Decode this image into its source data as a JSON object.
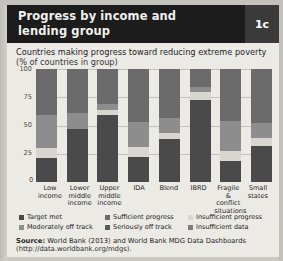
{
  "header": {
    "title_line1": "Progress by income and",
    "title_line2": "lending group",
    "badge": "1c"
  },
  "subtitle": {
    "line1": "Countries making progress toward reducing extreme poverty",
    "line2": "(% of countries in group)"
  },
  "source": {
    "label": "Source:",
    "text": " World Bank (2013) and World Bank MDG Data Dashboards",
    "url": "(http://data.worldbank.org/mdgs)."
  },
  "colors": {
    "target_met": "#4a4a4a",
    "moderately_off_track": "#8d8d8d",
    "sufficient_progress": "#6b6b6b",
    "seriously_off_track": "#5a5a5a",
    "insufficient_progress": "#d8d6d1",
    "insufficient_data": "#7d7d7d",
    "header_bg": "#1c1c1c",
    "badge_bg": "#3a3a3a",
    "card_bg": "#eceae5"
  },
  "chart_data": {
    "type": "bar",
    "subtype": "stacked-bar-100",
    "title": "Countries making progress toward reducing extreme poverty",
    "subtitle": "(% of countries in group)",
    "xlabel": "",
    "ylabel": "% of countries in group",
    "ylim": [
      0,
      100
    ],
    "yticks": [
      0,
      25,
      50,
      75,
      100
    ],
    "ytick_labels": [
      "0",
      "25",
      "50",
      "75",
      "100"
    ],
    "grid": true,
    "legend_position": "bottom",
    "categories": [
      "Low income",
      "Lower middle income",
      "Upper middle income",
      "IDA",
      "Blend",
      "IBRD",
      "Fragile & conflict situations",
      "Small states"
    ],
    "series": [
      {
        "name": "Target met",
        "color": "#4a4a4a",
        "values": [
          21,
          47,
          59,
          22,
          38,
          73,
          19,
          32
        ]
      },
      {
        "name": "Insufficient progress",
        "color": "#d8d6d1",
        "values": [
          9,
          0,
          5,
          9,
          5,
          7,
          8,
          7
        ]
      },
      {
        "name": "Moderately off track",
        "color": "#8d8d8d",
        "values": [
          29,
          14,
          5,
          22,
          14,
          4,
          27,
          13
        ]
      },
      {
        "name": "Sufficient progress",
        "color": "#6b6b6b",
        "values": [
          41,
          39,
          31,
          47,
          43,
          16,
          46,
          48
        ]
      }
    ],
    "legend_entries": [
      "Target met",
      "Moderately off track",
      "Sufficient progress",
      "Seriously off track",
      "Insufficient progress",
      "Insufficient data"
    ]
  },
  "legend": {
    "col1": [
      {
        "label": "Target met",
        "color": "#4a4a4a"
      },
      {
        "label": "Moderately off track",
        "color": "#8d8d8d"
      }
    ],
    "col2": [
      {
        "label": "Sufficient progress",
        "color": "#6b6b6b"
      },
      {
        "label": "Seriously off track",
        "color": "#5a5a5a"
      }
    ],
    "col3": [
      {
        "label": "Insufficient progress",
        "color": "#d8d6d1"
      },
      {
        "label": "Insufficient data",
        "color": "#7d7d7d"
      }
    ]
  },
  "axis": {
    "zero_label": "0"
  }
}
